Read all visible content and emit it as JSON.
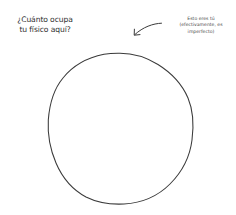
{
  "question": {
    "lines": [
      "¿Cuánto ocupa",
      "tu físico aquí?"
    ]
  },
  "note": {
    "lines": [
      "Esto eres tú",
      "(efectivamente, es",
      "imperfecto)"
    ]
  },
  "icons": {
    "arrow": "curved-arrow-pointing-down-left",
    "shape": "hand-drawn-circle"
  },
  "colors": {
    "background": "#ffffff",
    "ink": "#333333"
  }
}
